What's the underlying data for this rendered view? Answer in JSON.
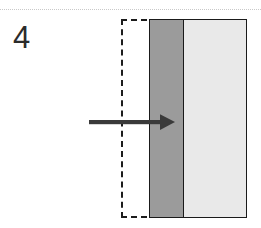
{
  "figure": {
    "panel_label": "4",
    "width_px": 261,
    "height_px": 228,
    "background_color": "#ffffff"
  },
  "top_rule": {
    "style": "dotted",
    "color": "#c9c9c9",
    "y": 9
  },
  "dashed_region": {
    "name": "reference-outline",
    "style": "dashed",
    "color": "#1c1c1c",
    "x": 121,
    "y": 19,
    "width": 126,
    "height": 199
  },
  "bar": {
    "border_color": "#1a1a1a",
    "x": 149,
    "y": 19,
    "width": 98,
    "height": 199,
    "bands": [
      {
        "name": "dark-band",
        "color": "#9b9b9b",
        "width": 34
      },
      {
        "name": "light-band",
        "color": "#e9e9e9",
        "width": 63
      }
    ]
  },
  "arrow": {
    "direction": "right",
    "color": "#3a3a3a",
    "start_x": 89,
    "end_x": 173,
    "y": 122,
    "shaft_thickness": 4
  }
}
